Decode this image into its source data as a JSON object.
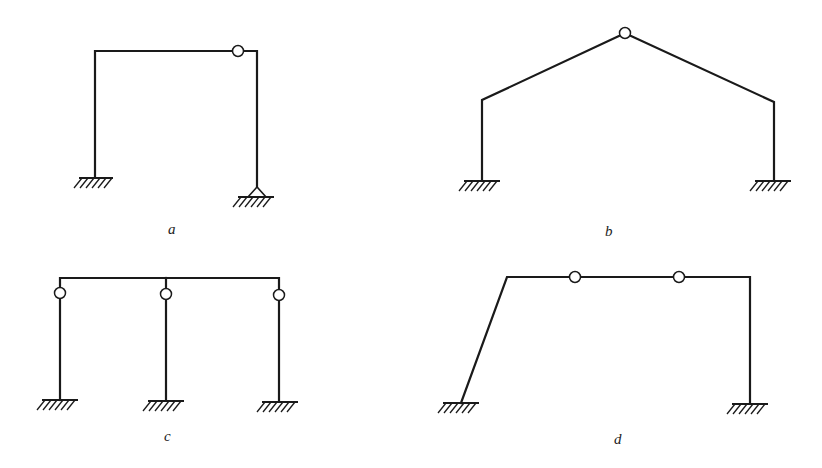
{
  "figure": {
    "panels": [
      {
        "id": "a",
        "label": "a",
        "description": "Portal frame: fixed left support, pinned right support, hinge in beam near right corner"
      },
      {
        "id": "b",
        "label": "b",
        "description": "Gable (pitched-roof) frame: two fixed supports, hinge at ridge apex"
      },
      {
        "id": "c",
        "label": "c",
        "description": "Three-column frame: continuous top beam, three fixed-base columns each hinged just below the beam"
      },
      {
        "id": "d",
        "label": "d",
        "description": "Frame with inclined left leg: two fixed supports, two hinges in top beam"
      }
    ]
  },
  "colors": {
    "line": "#1a1a1a",
    "background": "#ffffff"
  }
}
